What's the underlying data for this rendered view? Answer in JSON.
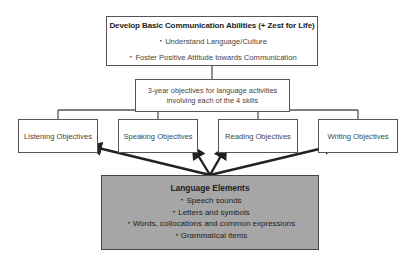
{
  "top_box": {
    "title": "Develop Basic Communication Abilities (+ Zest for Life)",
    "items": [
      "・Understand Language/Culture",
      "・Foster Positive Attitude towards Communication"
    ]
  },
  "middle_box": {
    "text": "3-year objectives for language activities involving each of the 4 skills"
  },
  "objectives": [
    {
      "label": "Listening Objectives"
    },
    {
      "label": "Speaking Objectives"
    },
    {
      "label": "Reading Objectives"
    },
    {
      "label": "Writing Objectives"
    }
  ],
  "language_elements": {
    "title": "Language Elements",
    "items": [
      "・Speech sounds",
      "・Letters and symbols",
      "・Words, collocations and common expressions",
      "・Grammatical items"
    ],
    "fill_color": "#a6a6a6"
  },
  "colors": {
    "border": "#555555",
    "arrow": "#222222"
  }
}
